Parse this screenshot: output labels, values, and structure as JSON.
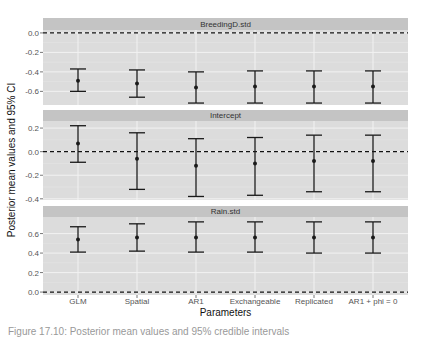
{
  "chart_data": {
    "type": "errorbar",
    "layout": "facet_wrap (3 rows, free y-scales)",
    "xlabel": "Parameters",
    "ylabel": "Posterior mean values and 95% CI",
    "categories": [
      "GLM",
      "Spatial",
      "AR1",
      "Exchangeable",
      "Replicated",
      "AR1 + phi = 0"
    ],
    "reference_line": {
      "y": 0.0,
      "style": "dashed"
    },
    "grid": true,
    "colors": {
      "panel_bg": "#dcdcdc",
      "strip_bg": "#c4c4c4",
      "grid": "#f2f2f2",
      "errorbar": "#1a1a1a"
    },
    "facets": [
      {
        "name": "BreedingD.std",
        "ylim": [
          -0.74,
          0.03
        ],
        "yticks": [
          0.0,
          -0.2,
          -0.4,
          -0.6
        ],
        "ytick_labels": [
          "0.0",
          "-0.2",
          "-0.4",
          "-0.6"
        ],
        "mean": [
          -0.49,
          -0.52,
          -0.56,
          -0.55,
          -0.55,
          -0.55
        ],
        "lower": [
          -0.6,
          -0.66,
          -0.72,
          -0.72,
          -0.72,
          -0.72
        ],
        "upper": [
          -0.37,
          -0.38,
          -0.4,
          -0.39,
          -0.39,
          -0.39
        ]
      },
      {
        "name": "Intercept",
        "ylim": [
          -0.41,
          0.26
        ],
        "yticks": [
          0.2,
          0.0,
          -0.2,
          -0.4
        ],
        "ytick_labels": [
          "0.2",
          "0.0",
          "-0.2",
          "-0.4"
        ],
        "mean": [
          0.07,
          -0.06,
          -0.12,
          -0.1,
          -0.08,
          -0.08
        ],
        "lower": [
          -0.09,
          -0.32,
          -0.38,
          -0.37,
          -0.34,
          -0.34
        ],
        "upper": [
          0.22,
          0.16,
          0.11,
          0.12,
          0.14,
          0.14
        ]
      },
      {
        "name": "Rain.std",
        "ylim": [
          -0.03,
          0.77
        ],
        "yticks": [
          0.6,
          0.4,
          0.2,
          0.0
        ],
        "ytick_labels": [
          "0.6",
          "0.4",
          "0.2",
          "0.0"
        ],
        "mean": [
          0.54,
          0.56,
          0.56,
          0.56,
          0.56,
          0.56
        ],
        "lower": [
          0.41,
          0.42,
          0.41,
          0.41,
          0.4,
          0.4
        ],
        "upper": [
          0.67,
          0.7,
          0.72,
          0.72,
          0.72,
          0.72
        ]
      }
    ]
  },
  "caption": "Figure 17.10: Posterior mean values and 95% credible intervals"
}
